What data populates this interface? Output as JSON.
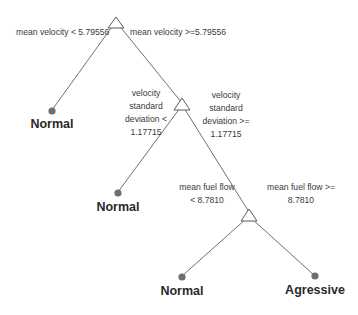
{
  "diagram": {
    "type": "decision-tree",
    "colors": {
      "line": "#707070",
      "node_stroke": "#5a5a5a",
      "leaf_dot": "#6e6e6e",
      "text": "#3a3a3a"
    },
    "nodes": [
      {
        "id": "root",
        "split": "mean velocity",
        "left_label": "mean velocity < 5.79556",
        "right_label": "mean velocity >=5.79556"
      },
      {
        "id": "n2",
        "split": "velocity standard deviation",
        "left_label_lines": [
          "velocity",
          "standard",
          "deviation <",
          "1.17715"
        ],
        "right_label_lines": [
          "velocity",
          "standard",
          "deviation >=",
          "1.17715"
        ]
      },
      {
        "id": "n3",
        "split": "mean fuel flow",
        "left_label_lines": [
          "mean fuel flow",
          "< 8.7810"
        ],
        "right_label_lines": [
          "mean fuel flow >=",
          "8.7810"
        ]
      }
    ],
    "leaves": [
      {
        "id": "leaf1",
        "label": "Normal"
      },
      {
        "id": "leaf2",
        "label": "Normal"
      },
      {
        "id": "leaf3",
        "label": "Normal"
      },
      {
        "id": "leaf4",
        "label": "Agressive"
      }
    ]
  }
}
